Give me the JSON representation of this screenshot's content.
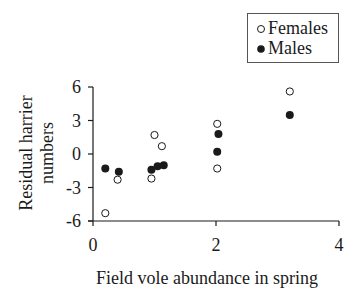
{
  "chart_data": {
    "type": "scatter",
    "title": "",
    "xlabel": "Field vole abundance in spring",
    "ylabel": "Residual harrier numbers",
    "ylabel_lines": [
      "Residual harrier",
      "numbers"
    ],
    "xlim": [
      0,
      4
    ],
    "ylim": [
      -6,
      6
    ],
    "xticks": [
      "0",
      "2",
      "4"
    ],
    "yticks": [
      "6",
      "3",
      "0",
      "-3",
      "-6"
    ],
    "grid": false,
    "legend_position": "top-right",
    "series": [
      {
        "name": "Females",
        "marker": "open-circle",
        "points": [
          {
            "x": 0.2,
            "y": -5.3
          },
          {
            "x": 0.4,
            "y": -2.3
          },
          {
            "x": 0.95,
            "y": -2.2
          },
          {
            "x": 1.0,
            "y": 1.7
          },
          {
            "x": 1.12,
            "y": 0.7
          },
          {
            "x": 2.02,
            "y": 2.7
          },
          {
            "x": 2.02,
            "y": -1.3
          },
          {
            "x": 3.2,
            "y": 5.6
          }
        ]
      },
      {
        "name": "Males",
        "marker": "filled-circle",
        "points": [
          {
            "x": 0.2,
            "y": -1.3
          },
          {
            "x": 0.42,
            "y": -1.6
          },
          {
            "x": 0.95,
            "y": -1.4
          },
          {
            "x": 1.05,
            "y": -1.1
          },
          {
            "x": 1.15,
            "y": -1.0
          },
          {
            "x": 2.04,
            "y": 1.8
          },
          {
            "x": 2.02,
            "y": 0.2
          },
          {
            "x": 3.2,
            "y": 3.5
          }
        ]
      }
    ]
  },
  "legend": {
    "items": [
      {
        "label": "Females"
      },
      {
        "label": "Males"
      }
    ]
  },
  "colors": {
    "ink": "#1a1a1a",
    "background": "#ffffff"
  }
}
